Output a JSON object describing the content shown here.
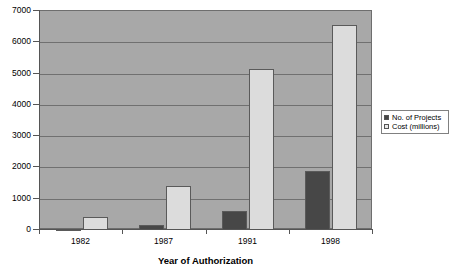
{
  "chart_data": {
    "type": "bar",
    "title": "",
    "xlabel": "Year of Authorization",
    "ylabel": "",
    "categories": [
      "1982",
      "1987",
      "1991",
      "1998"
    ],
    "series": [
      {
        "name": "No. of Projects",
        "color": "#474747",
        "values": [
          40,
          150,
          600,
          1900
        ]
      },
      {
        "name": "Cost (millions)",
        "color": "#dcdcdc",
        "values": [
          430,
          1400,
          5150,
          6550
        ]
      }
    ],
    "ylim": [
      0,
      7000
    ],
    "yticks": [
      0,
      1000,
      2000,
      3000,
      4000,
      5000,
      6000,
      7000
    ],
    "ytick_labels": [
      "0",
      "1000",
      "2000",
      "3000",
      "4000",
      "5000",
      "6000",
      "7000"
    ],
    "grid": true,
    "legend_position": "right",
    "plot_background": "#a8a8a8",
    "figure_background": "#ffffff"
  },
  "legend": {
    "entries": [
      {
        "label": "No. of Projects"
      },
      {
        "label": "Cost (millions)"
      }
    ]
  },
  "axis": {
    "x_title": "Year of Authorization"
  }
}
